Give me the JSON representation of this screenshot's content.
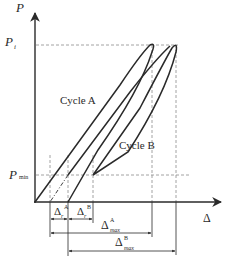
{
  "diagram": {
    "type": "load-displacement hysteresis diagram",
    "axes": {
      "y_label": "P",
      "x_label": "Δ"
    },
    "levels": {
      "p_i": {
        "symbol": "P",
        "subscript": "i"
      },
      "p_min": {
        "symbol": "P",
        "subscript": "min"
      }
    },
    "curves": [
      {
        "id": "cycle-a",
        "label": "Cycle A"
      },
      {
        "id": "cycle-b",
        "label": "Cycle B"
      }
    ],
    "dimensions": {
      "delta_r_a": {
        "symbol": "Δ",
        "subscript": "r",
        "superscript": "A"
      },
      "delta_r_b": {
        "symbol": "Δ",
        "subscript": "r",
        "superscript": "B"
      },
      "delta_max_a": {
        "symbol": "Δ",
        "subscript": "max",
        "superscript": "A"
      },
      "delta_max_b": {
        "symbol": "Δ",
        "subscript": "max",
        "superscript": "B"
      }
    },
    "colors": {
      "line": "#2a2a2a",
      "dashed": "#8a8a8a",
      "background": "#ffffff"
    }
  }
}
